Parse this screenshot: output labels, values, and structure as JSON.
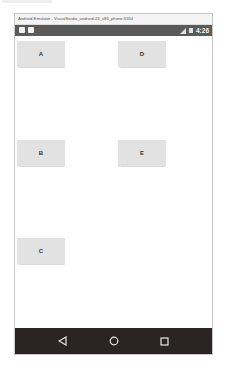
{
  "window": {
    "title": "Android Emulator - VisualStudio_android-23_x86_phone:5554"
  },
  "status_bar": {
    "left_icons": [
      "notification-icon",
      "notification-icon"
    ],
    "right_icons": [
      "signal-icon",
      "battery-icon"
    ],
    "time": "4:26",
    "background": "#5a5a5a"
  },
  "content": {
    "buttons": [
      {
        "label": "A"
      },
      {
        "label": "D"
      },
      {
        "label": "B"
      },
      {
        "label": "E"
      },
      {
        "label": "C"
      }
    ],
    "button_color": "#e2e2e2"
  },
  "nav_bar": {
    "buttons": [
      {
        "icon": "back-icon"
      },
      {
        "icon": "home-icon"
      },
      {
        "icon": "recents-icon"
      }
    ],
    "background": "#2a2424"
  }
}
